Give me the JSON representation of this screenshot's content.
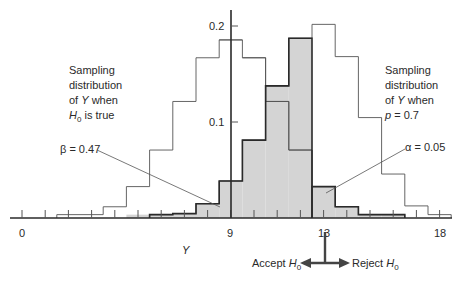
{
  "chart_data": {
    "type": "bar",
    "title": "",
    "xlabel": "Y",
    "ylabel": "",
    "x_ticks": [
      0,
      9,
      13,
      18
    ],
    "y_ticks": [
      0.1,
      0.2
    ],
    "xlim": [
      -0.5,
      18.5
    ],
    "ylim": [
      0,
      0.22
    ],
    "grid": false,
    "categories": [
      0,
      1,
      2,
      3,
      4,
      5,
      6,
      7,
      8,
      9,
      10,
      11,
      12,
      13,
      14,
      15,
      16,
      17,
      18
    ],
    "series": [
      {
        "name": "Sampling distribution of Y when H0 is true",
        "values": [
          0.0,
          0.0001,
          0.0006,
          0.0031,
          0.0117,
          0.0327,
          0.0708,
          0.1214,
          0.1669,
          0.1855,
          0.1669,
          0.1214,
          0.0708,
          0.0327,
          0.0117,
          0.0031,
          0.0006,
          0.0001,
          0.0
        ]
      },
      {
        "name": "Sampling distribution of Y when p = 0.7",
        "values": [
          0.0,
          0.0,
          0.0,
          0.0,
          0.0,
          0.0002,
          0.0012,
          0.0046,
          0.0149,
          0.0386,
          0.0811,
          0.1376,
          0.1873,
          0.2017,
          0.1681,
          0.1046,
          0.0458,
          0.0126,
          0.0016
        ]
      }
    ],
    "annotations": [
      {
        "text": "β = 0.47",
        "region": "p = 0.7 distribution for Y ≤ 12 (shaded)"
      },
      {
        "text": "α = 0.05",
        "region": "H0 distribution for Y ≥ 13 (shaded)"
      },
      {
        "text": "Accept H0",
        "direction": "left of 12.5"
      },
      {
        "text": "Reject H0",
        "direction": "right of 12.5"
      }
    ],
    "critical_value": 12.5
  },
  "labels": {
    "h0_dist": [
      "Sampling",
      "distribution",
      "of ",
      "Y",
      " when",
      "H",
      "0",
      " is true"
    ],
    "alt_dist": [
      "Sampling",
      "distribution",
      "of ",
      "Y",
      " when",
      "p",
      " = 0.7"
    ],
    "beta": "β = 0.47",
    "alpha": "α = 0.05",
    "xlabel": "Y",
    "accept": "Accept ",
    "reject": "Reject ",
    "h": "H",
    "sub0": "0",
    "tick_0": "0",
    "tick_9": "9",
    "tick_13": "13",
    "tick_18": "18",
    "ytick_01": "0.1",
    "ytick_02": "0.2"
  },
  "colors": {
    "shade": "#d4d4d4",
    "line": "#2a2a2a",
    "thin": "#555555"
  }
}
